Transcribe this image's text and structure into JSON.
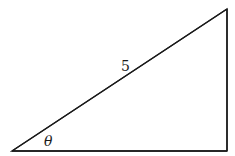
{
  "diagram": {
    "type": "right-triangle",
    "stroke_color": "#1a1a1a",
    "background": "#ffffff",
    "vertices": {
      "bottom_left": [
        12,
        151
      ],
      "top_right": [
        227,
        9
      ],
      "bottom_right": [
        227,
        151
      ]
    },
    "labels": {
      "hypotenuse": "5",
      "angle": "θ"
    }
  }
}
